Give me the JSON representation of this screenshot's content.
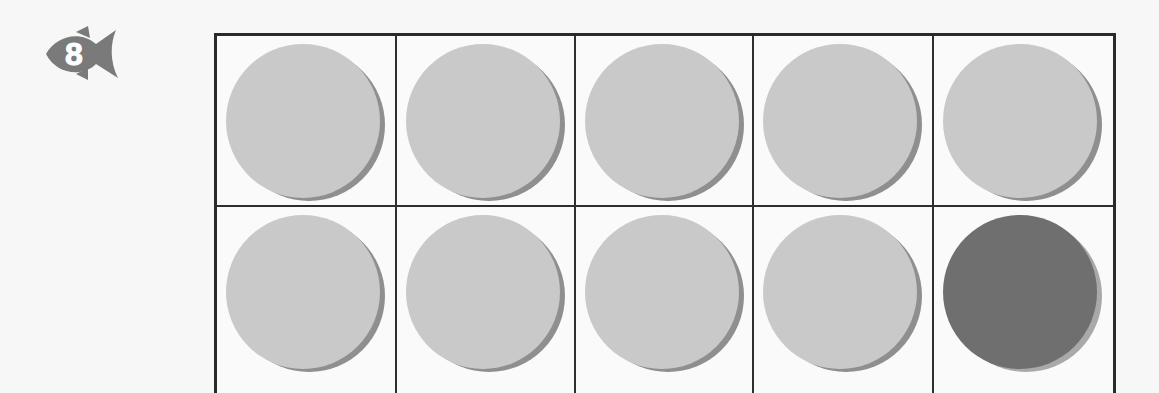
{
  "badge": {
    "number": "8",
    "shape": "fish-icon",
    "color": "#7a7a7a"
  },
  "ten_frame": {
    "rows": 2,
    "columns": 5,
    "colors": {
      "light": "#c9c9c9",
      "dark": "#6f6f6f",
      "grid": "#2a2a2a"
    },
    "cells": [
      {
        "row": 1,
        "col": 1,
        "counter": "light"
      },
      {
        "row": 1,
        "col": 2,
        "counter": "light"
      },
      {
        "row": 1,
        "col": 3,
        "counter": "light"
      },
      {
        "row": 1,
        "col": 4,
        "counter": "light"
      },
      {
        "row": 1,
        "col": 5,
        "counter": "light"
      },
      {
        "row": 2,
        "col": 1,
        "counter": "light"
      },
      {
        "row": 2,
        "col": 2,
        "counter": "light"
      },
      {
        "row": 2,
        "col": 3,
        "counter": "light"
      },
      {
        "row": 2,
        "col": 4,
        "counter": "light"
      },
      {
        "row": 2,
        "col": 5,
        "counter": "dark"
      }
    ]
  }
}
